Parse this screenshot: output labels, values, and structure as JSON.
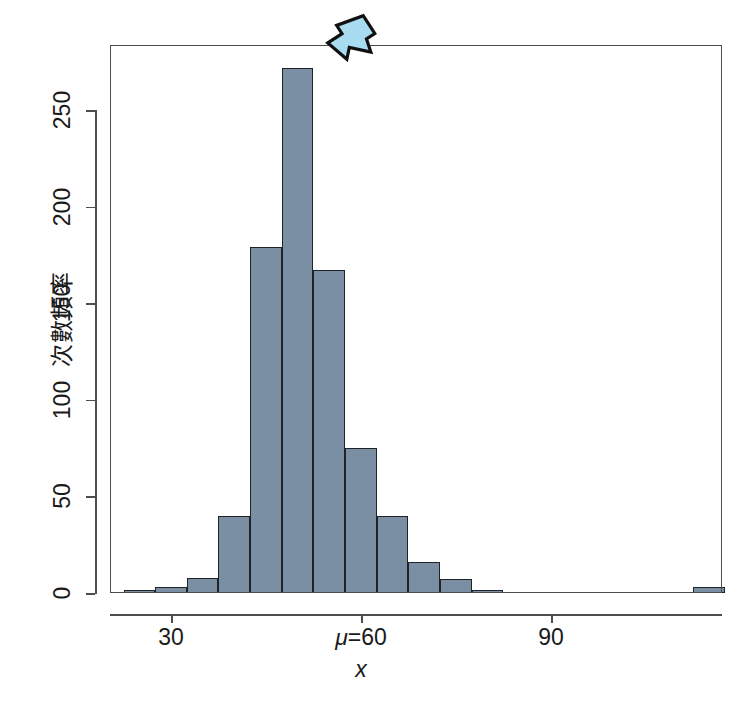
{
  "chart_data": {
    "type": "bar",
    "title": "",
    "subtitle": "",
    "xlabel": "x",
    "ylabel": "次數頻率",
    "xlim": [
      22.5,
      117.5
    ],
    "ylim": [
      0,
      283
    ],
    "grid": false,
    "legend": null,
    "bin_width": 5,
    "categories": [
      "22.5-27.5",
      "27.5-32.5",
      "32.5-37.5",
      "37.5-42.5",
      "42.5-47.5",
      "47.5-52.5",
      "52.5-57.5",
      "57.5-62.5",
      "62.5-67.5",
      "67.5-72.5",
      "72.5-77.5",
      "77.5-82.5",
      "82.5-87.5",
      "87.5-92.5",
      "92.5-97.5",
      "112.5-117.5"
    ],
    "bin_starts": [
      22.5,
      27.5,
      32.5,
      37.5,
      42.5,
      47.5,
      52.5,
      57.5,
      62.5,
      67.5,
      72.5,
      77.5,
      82.5,
      87.5,
      92.5,
      112.5
    ],
    "values": [
      1,
      3,
      8,
      40,
      179,
      272,
      167,
      75,
      40,
      16,
      7,
      1,
      0,
      0,
      0,
      3
    ],
    "bar_fill_color": "#7a8fa3",
    "bar_border_color": "#1f2326",
    "x_ticks": [
      {
        "value": 30,
        "label": "30",
        "italic_prefix": ""
      },
      {
        "value": 60,
        "label": "=60",
        "italic_prefix": "μ"
      },
      {
        "value": 90,
        "label": "90",
        "italic_prefix": ""
      }
    ],
    "y_ticks": [
      {
        "value": 0,
        "label": "0"
      },
      {
        "value": 50,
        "label": "50"
      },
      {
        "value": 100,
        "label": "100"
      },
      {
        "value": 150,
        "label": "150"
      },
      {
        "value": 200,
        "label": "200"
      },
      {
        "value": 250,
        "label": "250"
      }
    ],
    "annotations": [
      {
        "name": "peak-arrow",
        "kind": "arrow",
        "points_to_value": 272,
        "points_to_x": 58.5,
        "direction": "down-left",
        "fill_color": "#a8dcf0",
        "border_color": "#111111"
      }
    ]
  }
}
